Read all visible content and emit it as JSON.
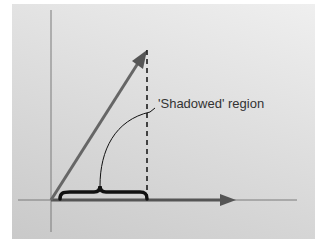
{
  "diagram": {
    "annotation": "'Shadowed' region",
    "colors": {
      "axis": "#777777",
      "vector": "#555555",
      "brace": "#111111",
      "dashed": "#111111",
      "background_light": "#efefef",
      "background_dark": "#c9c9c9"
    },
    "elements": [
      "y-axis",
      "x-axis",
      "diagonal-vector",
      "projection-vector",
      "dashed-drop-line",
      "curly-brace",
      "leader-curve"
    ]
  }
}
